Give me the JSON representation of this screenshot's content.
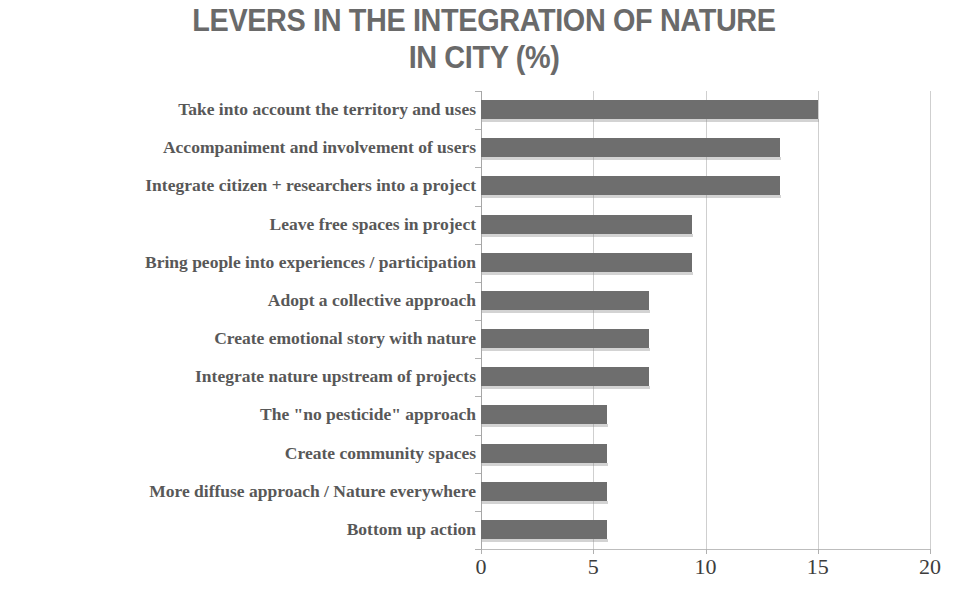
{
  "chart_data": {
    "type": "bar",
    "orientation": "horizontal",
    "title": "LEVERS IN THE INTEGRATION OF NATURE\nIN CITY (%)",
    "xlabel": "",
    "ylabel": "",
    "xlim": [
      0,
      20
    ],
    "xticks": [
      0,
      5,
      10,
      15,
      20
    ],
    "xtick_labels": [
      "0",
      "5",
      "10",
      "15",
      "20"
    ],
    "grid": true,
    "grid_axis": "x",
    "legend": false,
    "bar_color": "#6e6e6e",
    "title_color": "#6a6a6a",
    "label_color": "#585858",
    "gridline_color": "#cfcfcf",
    "categories": [
      "Take into account the territory and uses",
      "Accompaniment and involvement of users",
      "Integrate citizen + researchers  into a project",
      "Leave free spaces in project",
      "Bring people into experiences / participation",
      "Adopt a collective approach",
      "Create emotional story with nature",
      "Integrate nature upstream of projects",
      "The \"no pesticide\" approach",
      "Create community spaces",
      "More diffuse approach / Nature everywhere",
      "Bottom up action"
    ],
    "values": [
      15,
      13.3,
      13.3,
      9.4,
      9.4,
      7.5,
      7.5,
      7.5,
      5.6,
      5.6,
      5.6,
      5.6
    ]
  }
}
